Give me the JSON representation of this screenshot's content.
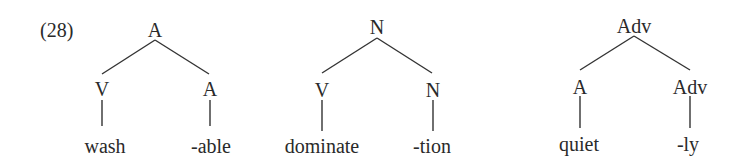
{
  "example_number": "(28)",
  "trees": [
    {
      "root": "A",
      "children": [
        {
          "label": "V",
          "leaf": "wash"
        },
        {
          "label": "A",
          "leaf": "-able"
        }
      ]
    },
    {
      "root": "N",
      "children": [
        {
          "label": "V",
          "leaf": "dominate"
        },
        {
          "label": "N",
          "leaf": "-tion"
        }
      ]
    },
    {
      "root": "Adv",
      "children": [
        {
          "label": "A",
          "leaf": "quiet"
        },
        {
          "label": "Adv",
          "leaf": "-ly"
        }
      ]
    }
  ]
}
